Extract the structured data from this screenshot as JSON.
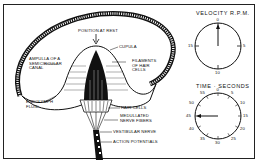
{
  "diagram": {
    "labels": {
      "position_at_rest": "POSITION AT REST",
      "cupula": "CUPULA",
      "ampulla_line1": "AMPULLA OF A",
      "ampulla_line2": "SEMICIRCULAR",
      "ampulla_line3": "CANAL",
      "filaments_line1": "FILAMENTS",
      "filaments_line2": "OF HAIR",
      "filaments_line3": "CELLS",
      "endolymph_line1": "ENDOLYMPH",
      "endolymph_line2": "FLUID",
      "hair_cells": "HAIR CELLS",
      "medullated_line1": "MEDULLATED",
      "medullated_line2": "NERVE FIBERS",
      "vestibular_nerve": "VESTIBULAR NERVE",
      "action_potentials": "ACTION POTENTIALS"
    },
    "velocity_dial": {
      "title": "VELOCITY  R.P.M.",
      "ticks": [
        "0",
        "5",
        "10",
        "15"
      ],
      "pointer_value": "0"
    },
    "time_dial": {
      "title": "TIME · SECONDS",
      "ticks": [
        "0",
        "5",
        "10",
        "15",
        "20",
        "25",
        "30",
        "35",
        "40",
        "45",
        "50",
        "55"
      ],
      "pointer_value": "45"
    },
    "colors": {
      "ink": "#111111",
      "paper": "#ffffff"
    }
  }
}
